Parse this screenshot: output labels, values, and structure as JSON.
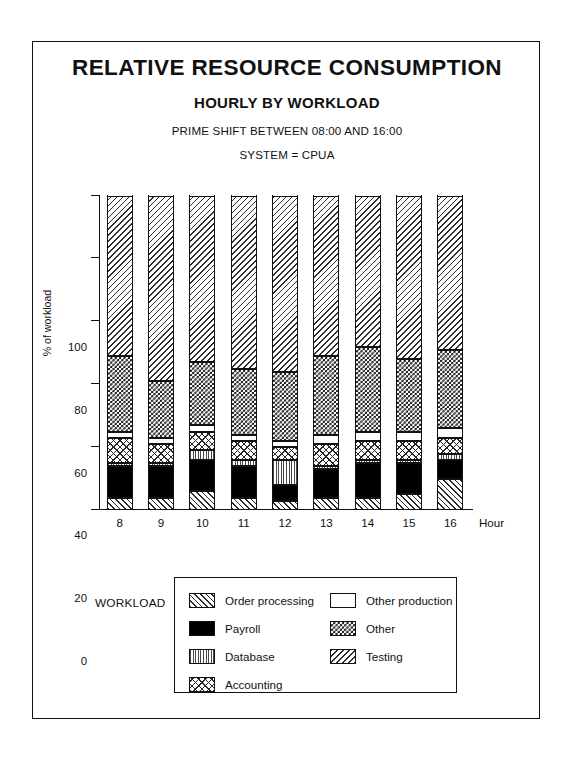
{
  "titles": {
    "main": "RELATIVE RESOURCE CONSUMPTION",
    "sub": "HOURLY BY WORKLOAD",
    "note1": "PRIME SHIFT BETWEEN 08:00 AND 16:00",
    "note2": "SYSTEM = CPUA"
  },
  "legend": {
    "label": "WORKLOAD",
    "column1": [
      {
        "key": "order",
        "name": "order-processing",
        "label": "Order processing"
      },
      {
        "key": "payroll",
        "name": "payroll",
        "label": "Payroll"
      },
      {
        "key": "database",
        "name": "database",
        "label": "Database"
      },
      {
        "key": "accounting",
        "name": "accounting",
        "label": "Accounting"
      }
    ],
    "column2": [
      {
        "key": "otherprod",
        "name": "other-production",
        "label": "Other production"
      },
      {
        "key": "other",
        "name": "other",
        "label": "Other"
      },
      {
        "key": "testing",
        "name": "testing",
        "label": "Testing"
      }
    ]
  },
  "chart_data": {
    "type": "bar",
    "subtype": "stacked-percent",
    "title": "RELATIVE RESOURCE CONSUMPTION",
    "subtitle": "HOURLY BY WORKLOAD",
    "annotations": [
      "PRIME SHIFT BETWEEN 08:00 AND 16:00",
      "SYSTEM = CPUA"
    ],
    "xlabel": "Hour",
    "ylabel": "% of workload",
    "ylim": [
      0,
      100
    ],
    "yticks": [
      0,
      20,
      40,
      60,
      80,
      100
    ],
    "grid": false,
    "legend_position": "bottom",
    "legend_title": "WORKLOAD",
    "categories": [
      "8",
      "9",
      "10",
      "11",
      "12",
      "13",
      "14",
      "15",
      "16"
    ],
    "series": [
      {
        "name": "Order processing",
        "key": "order",
        "values": [
          4,
          4,
          6,
          4,
          3,
          4,
          4,
          5,
          10
        ]
      },
      {
        "name": "Payroll",
        "key": "payroll",
        "values": [
          10,
          10,
          10,
          10,
          5,
          9,
          11,
          10,
          6
        ]
      },
      {
        "name": "Database",
        "key": "database",
        "values": [
          1,
          1,
          3,
          2,
          8,
          1,
          1,
          1,
          2
        ]
      },
      {
        "name": "Accounting",
        "key": "accounting",
        "values": [
          8,
          6,
          6,
          6,
          4,
          7,
          6,
          6,
          5
        ]
      },
      {
        "name": "Other production",
        "key": "otherprod",
        "values": [
          2,
          2,
          2,
          2,
          2,
          3,
          3,
          3,
          3
        ]
      },
      {
        "name": "Other",
        "key": "other",
        "values": [
          24,
          18,
          20,
          21,
          22,
          25,
          27,
          23,
          25
        ]
      },
      {
        "name": "Testing",
        "key": "testing",
        "values": [
          51,
          59,
          53,
          55,
          56,
          51,
          48,
          52,
          49
        ]
      }
    ]
  }
}
